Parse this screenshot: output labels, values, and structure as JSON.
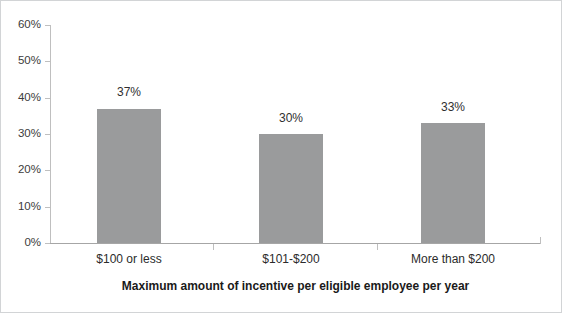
{
  "chart_data": {
    "type": "bar",
    "title": "",
    "xlabel": "Maximum amount of incentive per eligible employee per year",
    "ylabel": "",
    "categories": [
      "$100 or less",
      "$101-$200",
      "More than $200"
    ],
    "values": [
      37,
      30,
      33
    ],
    "data_labels": [
      "37%",
      "30%",
      "33%"
    ],
    "ylim": [
      0,
      60
    ],
    "ytick_values": [
      0,
      10,
      20,
      30,
      40,
      50,
      60
    ],
    "ytick_labels": [
      "0%",
      "10%",
      "20%",
      "30%",
      "40%",
      "50%",
      "60%"
    ],
    "grid": false,
    "legend": false,
    "legend_position": "none",
    "bar_color": "#9a9b9c",
    "axis_color": "#bfbfbf",
    "text_color": "#2b2b2b",
    "border_color": "#d2d4d6"
  }
}
